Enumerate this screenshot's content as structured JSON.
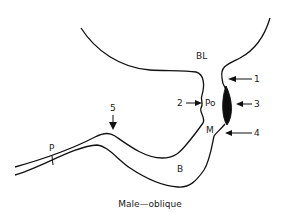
{
  "diagram": {
    "caption": "Male—oblique",
    "region_labels": {
      "bl": "BL",
      "po": "Po",
      "m": "M",
      "b": "B",
      "p": "P"
    },
    "arrow_labels": {
      "a1": "1",
      "a2": "2",
      "a3": "3",
      "a4": "4",
      "a5": "5"
    },
    "colors": {
      "stroke": "#111111",
      "fill_dark": "#0d0d0d",
      "background": "#ffffff"
    }
  }
}
